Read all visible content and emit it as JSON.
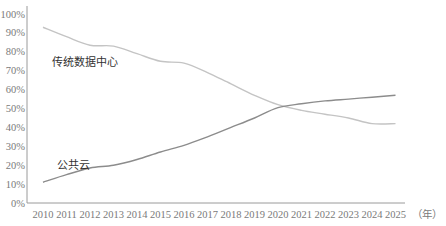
{
  "chart_data": {
    "type": "line",
    "title": "",
    "xlabel": "（年）",
    "ylabel": "",
    "ylim": [
      0,
      100
    ],
    "y_ticks": [
      "0%",
      "10%",
      "20%",
      "30%",
      "40%",
      "50%",
      "60%",
      "70%",
      "80%",
      "90%",
      "100%"
    ],
    "x": [
      "2010",
      "2011",
      "2012",
      "2013",
      "2014",
      "2015",
      "2016",
      "2017",
      "2018",
      "2019",
      "2020",
      "2021",
      "2022",
      "2023",
      "2024",
      "2025"
    ],
    "grid": false,
    "legend": "inline labels",
    "series": [
      {
        "name": "传统数据中心",
        "color": "#c4c4c4",
        "values": [
          93,
          88,
          83.5,
          83,
          79,
          75,
          74,
          69,
          63,
          57,
          52,
          49,
          47,
          45,
          42,
          42
        ]
      },
      {
        "name": "公共云",
        "color": "#8c8c8c",
        "values": [
          11,
          15,
          18.5,
          20,
          23,
          27,
          30.5,
          35,
          40,
          45,
          50.5,
          52.5,
          54,
          55,
          56,
          57
        ]
      }
    ]
  },
  "labels": {
    "traditional": "传统数据中心",
    "public_cloud": "公共云",
    "x_unit": "（年）"
  },
  "colors": {
    "axis": "#9a9a9a",
    "tick_text": "#7a7a7a",
    "label_text": "#333333"
  }
}
